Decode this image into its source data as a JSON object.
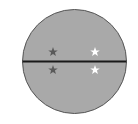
{
  "figure": {
    "colors": {
      "circle_fill": "#a9a9a9",
      "circle_stroke": "#555555",
      "divider": "#1a1a1a",
      "dark_star": "#5a5a5a",
      "light_star": "#ffffff"
    },
    "stars": [
      {
        "position": "upper-left",
        "color": "dark"
      },
      {
        "position": "upper-right",
        "color": "white"
      },
      {
        "position": "lower-left",
        "color": "dark"
      },
      {
        "position": "lower-right",
        "color": "white"
      }
    ]
  }
}
